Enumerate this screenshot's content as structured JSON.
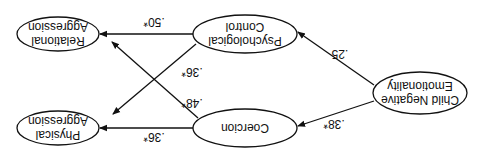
{
  "diagram": {
    "orientation": "rotated 180 degrees",
    "nodes": [
      {
        "id": "cne",
        "lines": [
          "Child Negative",
          "Emotionality"
        ]
      },
      {
        "id": "pc",
        "lines": [
          "Psychological",
          "Control"
        ]
      },
      {
        "id": "co",
        "lines": [
          "Coercion"
        ]
      },
      {
        "id": "ra",
        "lines": [
          "Relational",
          "Aggression"
        ]
      },
      {
        "id": "pa",
        "lines": [
          "Physical",
          "Aggression"
        ]
      }
    ],
    "edges": [
      {
        "from": "cne",
        "to": "pc",
        "label": ".25"
      },
      {
        "from": "cne",
        "to": "co",
        "label": ".38*"
      },
      {
        "from": "pc",
        "to": "ra",
        "label": ".50*"
      },
      {
        "from": "pc",
        "to": "pa",
        "label": ".36*"
      },
      {
        "from": "co",
        "to": "ra",
        "label": ".48*"
      },
      {
        "from": "co",
        "to": "pa",
        "label": ".36*"
      }
    ]
  }
}
